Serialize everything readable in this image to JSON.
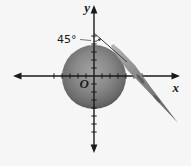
{
  "figure": {
    "labels": {
      "x_axis": "x",
      "y_axis": "y",
      "origin": "O",
      "angle": "45°"
    },
    "colors": {
      "background": "#f6f6f6",
      "axis": "#1a1a1a",
      "text": "#1a1a1a",
      "sphere_center": "#a2a2a2",
      "sphere_mid": "#8a8a8a",
      "sphere_edge": "#4e4e4e",
      "stick_light": "#b4b4b4",
      "stick_dark": "#616161",
      "thin_line": "#3f3f3f"
    }
  }
}
